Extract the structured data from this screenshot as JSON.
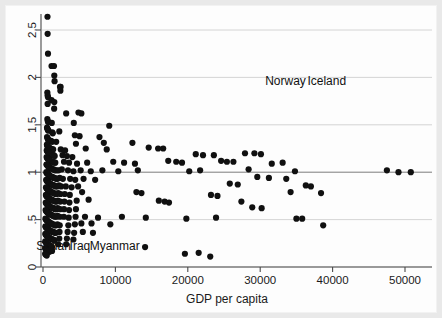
{
  "chart_data": {
    "type": "scatter",
    "title": "",
    "xlabel": "GDP per capita",
    "ylabel": "",
    "xlim": [
      -1500,
      53000
    ],
    "ylim": [
      0,
      2.72
    ],
    "xticks": [
      0,
      10000,
      20000,
      30000,
      40000,
      50000
    ],
    "xticklabels": [
      "0",
      "10000",
      "20000",
      "30000",
      "40000",
      "50000"
    ],
    "yticks": [
      0,
      0.5,
      1,
      1.5,
      2,
      2.5
    ],
    "yticklabels": [
      "0",
      ".5",
      "1",
      "1.5",
      "2",
      "2.5"
    ],
    "grid": "horizontal gridlines at each y tick; reference line emphasized at y=1",
    "reference_line_y": 1,
    "marker": "filled-circle",
    "marker_color": "#101010",
    "marker_size_px": 3.1,
    "legend": null,
    "annotations": [
      {
        "text": "Norway",
        "x": 33500,
        "y": 1.92,
        "anchor": "middle"
      },
      {
        "text": "Iceland",
        "x": 39200,
        "y": 1.92,
        "anchor": "middle"
      },
      {
        "text": "Sudan",
        "x": 1450,
        "y": 0.18,
        "anchor": "middle"
      },
      {
        "text": "Iraq",
        "x": 5100,
        "y": 0.18,
        "anchor": "middle"
      },
      {
        "text": "Myanmar",
        "x": 9900,
        "y": 0.18,
        "anchor": "middle"
      }
    ],
    "points": [
      [
        620,
        2.64
      ],
      [
        640,
        2.46
      ],
      [
        690,
        2.25
      ],
      [
        1180,
        2.12
      ],
      [
        1520,
        2.12
      ],
      [
        1560,
        2.02
      ],
      [
        1600,
        1.96
      ],
      [
        2350,
        1.9
      ],
      [
        2430,
        1.9
      ],
      [
        2400,
        1.86
      ],
      [
        600,
        1.84
      ],
      [
        640,
        1.81
      ],
      [
        700,
        1.79
      ],
      [
        1180,
        1.76
      ],
      [
        1560,
        1.74
      ],
      [
        640,
        1.72
      ],
      [
        1540,
        1.67
      ],
      [
        3200,
        1.62
      ],
      [
        4900,
        1.63
      ],
      [
        5300,
        1.62
      ],
      [
        600,
        1.56
      ],
      [
        660,
        1.54
      ],
      [
        700,
        1.53
      ],
      [
        1210,
        1.52
      ],
      [
        4250,
        1.52
      ],
      [
        9150,
        1.49
      ],
      [
        560,
        1.47
      ],
      [
        610,
        1.46
      ],
      [
        650,
        1.45
      ],
      [
        700,
        1.44
      ],
      [
        760,
        1.44
      ],
      [
        1280,
        1.42
      ],
      [
        1350,
        1.41
      ],
      [
        2250,
        1.43
      ],
      [
        4400,
        1.39
      ],
      [
        5050,
        1.38
      ],
      [
        7800,
        1.37
      ],
      [
        560,
        1.37
      ],
      [
        620,
        1.36
      ],
      [
        680,
        1.35
      ],
      [
        740,
        1.34
      ],
      [
        800,
        1.33
      ],
      [
        1120,
        1.33
      ],
      [
        1260,
        1.32
      ],
      [
        1820,
        1.32
      ],
      [
        4550,
        1.3
      ],
      [
        8400,
        1.31
      ],
      [
        12350,
        1.31
      ],
      [
        540,
        1.29
      ],
      [
        600,
        1.28
      ],
      [
        660,
        1.27
      ],
      [
        720,
        1.27
      ],
      [
        790,
        1.26
      ],
      [
        860,
        1.26
      ],
      [
        1050,
        1.25
      ],
      [
        1300,
        1.24
      ],
      [
        1400,
        1.24
      ],
      [
        2450,
        1.24
      ],
      [
        3050,
        1.23
      ],
      [
        5900,
        1.25
      ],
      [
        8800,
        1.24
      ],
      [
        14600,
        1.26
      ],
      [
        15900,
        1.25
      ],
      [
        16600,
        1.25
      ],
      [
        520,
        1.23
      ],
      [
        580,
        1.22
      ],
      [
        640,
        1.22
      ],
      [
        700,
        1.21
      ],
      [
        760,
        1.21
      ],
      [
        820,
        1.2
      ],
      [
        900,
        1.2
      ],
      [
        1000,
        1.19
      ],
      [
        1150,
        1.19
      ],
      [
        1330,
        1.18
      ],
      [
        1480,
        1.18
      ],
      [
        1620,
        1.17
      ],
      [
        2700,
        1.18
      ],
      [
        3300,
        1.17
      ],
      [
        4050,
        1.16
      ],
      [
        21100,
        1.19
      ],
      [
        22100,
        1.18
      ],
      [
        23600,
        1.18
      ],
      [
        27900,
        1.2
      ],
      [
        29200,
        1.2
      ],
      [
        30100,
        1.19
      ],
      [
        500,
        1.16
      ],
      [
        560,
        1.15
      ],
      [
        620,
        1.15
      ],
      [
        680,
        1.14
      ],
      [
        740,
        1.14
      ],
      [
        800,
        1.13
      ],
      [
        870,
        1.13
      ],
      [
        950,
        1.12
      ],
      [
        1060,
        1.12
      ],
      [
        1220,
        1.11
      ],
      [
        1390,
        1.11
      ],
      [
        1550,
        1.1
      ],
      [
        1700,
        1.1
      ],
      [
        2900,
        1.11
      ],
      [
        3600,
        1.1
      ],
      [
        4700,
        1.09
      ],
      [
        6100,
        1.1
      ],
      [
        9700,
        1.11
      ],
      [
        11200,
        1.1
      ],
      [
        12700,
        1.09
      ],
      [
        17300,
        1.12
      ],
      [
        18400,
        1.11
      ],
      [
        19200,
        1.1
      ],
      [
        24600,
        1.12
      ],
      [
        25400,
        1.11
      ],
      [
        26300,
        1.11
      ],
      [
        31600,
        1.09
      ],
      [
        33100,
        1.1
      ],
      [
        480,
        1.08
      ],
      [
        540,
        1.08
      ],
      [
        600,
        1.07
      ],
      [
        660,
        1.07
      ],
      [
        720,
        1.06
      ],
      [
        790,
        1.06
      ],
      [
        860,
        1.05
      ],
      [
        940,
        1.05
      ],
      [
        1030,
        1.04
      ],
      [
        1170,
        1.04
      ],
      [
        1320,
        1.03
      ],
      [
        1480,
        1.03
      ],
      [
        1640,
        1.02
      ],
      [
        1880,
        1.02
      ],
      [
        2150,
        1.02
      ],
      [
        2600,
        1.03
      ],
      [
        3450,
        1.02
      ],
      [
        4200,
        1.01
      ],
      [
        5200,
        1.02
      ],
      [
        6600,
        1.01
      ],
      [
        8200,
        1.02
      ],
      [
        10400,
        1.01
      ],
      [
        13100,
        1.02
      ],
      [
        20200,
        1.01
      ],
      [
        21700,
        1.02
      ],
      [
        28400,
        1.03
      ],
      [
        34800,
        1.01
      ],
      [
        47500,
        1.02
      ],
      [
        49100,
        1.0
      ],
      [
        50800,
        1.0
      ],
      [
        460,
        1.0
      ],
      [
        520,
        0.99
      ],
      [
        580,
        0.99
      ],
      [
        640,
        0.98
      ],
      [
        700,
        0.98
      ],
      [
        770,
        0.97
      ],
      [
        840,
        0.97
      ],
      [
        920,
        0.96
      ],
      [
        1010,
        0.96
      ],
      [
        1140,
        0.95
      ],
      [
        1290,
        0.95
      ],
      [
        1450,
        0.94
      ],
      [
        1610,
        0.94
      ],
      [
        1790,
        0.93
      ],
      [
        2000,
        0.93
      ],
      [
        2300,
        0.94
      ],
      [
        2750,
        0.93
      ],
      [
        3750,
        0.93
      ],
      [
        4450,
        0.92
      ],
      [
        5600,
        0.93
      ],
      [
        7200,
        0.92
      ],
      [
        29600,
        0.95
      ],
      [
        31200,
        0.94
      ],
      [
        33600,
        0.93
      ],
      [
        440,
        0.92
      ],
      [
        500,
        0.91
      ],
      [
        560,
        0.91
      ],
      [
        620,
        0.9
      ],
      [
        690,
        0.9
      ],
      [
        760,
        0.89
      ],
      [
        830,
        0.89
      ],
      [
        910,
        0.88
      ],
      [
        1000,
        0.88
      ],
      [
        1120,
        0.87
      ],
      [
        1250,
        0.87
      ],
      [
        1400,
        0.86
      ],
      [
        1560,
        0.86
      ],
      [
        1740,
        0.85
      ],
      [
        1950,
        0.85
      ],
      [
        2200,
        0.86
      ],
      [
        2500,
        0.85
      ],
      [
        3150,
        0.85
      ],
      [
        3950,
        0.84
      ],
      [
        4850,
        0.85
      ],
      [
        25800,
        0.88
      ],
      [
        26900,
        0.87
      ],
      [
        36300,
        0.86
      ],
      [
        37000,
        0.85
      ],
      [
        420,
        0.84
      ],
      [
        480,
        0.83
      ],
      [
        540,
        0.83
      ],
      [
        600,
        0.82
      ],
      [
        670,
        0.82
      ],
      [
        740,
        0.81
      ],
      [
        810,
        0.81
      ],
      [
        890,
        0.8
      ],
      [
        980,
        0.8
      ],
      [
        1100,
        0.79
      ],
      [
        1240,
        0.79
      ],
      [
        1380,
        0.78
      ],
      [
        1540,
        0.78
      ],
      [
        1720,
        0.77
      ],
      [
        1900,
        0.77
      ],
      [
        2100,
        0.78
      ],
      [
        2420,
        0.77
      ],
      [
        3000,
        0.77
      ],
      [
        3700,
        0.76
      ],
      [
        5400,
        0.79
      ],
      [
        12900,
        0.79
      ],
      [
        13600,
        0.78
      ],
      [
        23200,
        0.76
      ],
      [
        24100,
        0.75
      ],
      [
        34200,
        0.79
      ],
      [
        38400,
        0.78
      ],
      [
        400,
        0.76
      ],
      [
        460,
        0.75
      ],
      [
        520,
        0.75
      ],
      [
        580,
        0.74
      ],
      [
        650,
        0.74
      ],
      [
        720,
        0.73
      ],
      [
        790,
        0.73
      ],
      [
        870,
        0.72
      ],
      [
        960,
        0.72
      ],
      [
        1080,
        0.71
      ],
      [
        1210,
        0.71
      ],
      [
        1350,
        0.7
      ],
      [
        1510,
        0.7
      ],
      [
        1690,
        0.69
      ],
      [
        1880,
        0.69
      ],
      [
        2060,
        0.7
      ],
      [
        2380,
        0.69
      ],
      [
        2950,
        0.69
      ],
      [
        3650,
        0.68
      ],
      [
        4650,
        0.7
      ],
      [
        6300,
        0.71
      ],
      [
        16000,
        0.7
      ],
      [
        16800,
        0.69
      ],
      [
        17400,
        0.68
      ],
      [
        27400,
        0.69
      ],
      [
        380,
        0.68
      ],
      [
        440,
        0.67
      ],
      [
        500,
        0.67
      ],
      [
        560,
        0.66
      ],
      [
        630,
        0.66
      ],
      [
        700,
        0.65
      ],
      [
        770,
        0.65
      ],
      [
        850,
        0.64
      ],
      [
        940,
        0.64
      ],
      [
        1060,
        0.63
      ],
      [
        1190,
        0.63
      ],
      [
        1330,
        0.62
      ],
      [
        1490,
        0.62
      ],
      [
        1660,
        0.61
      ],
      [
        1850,
        0.61
      ],
      [
        2030,
        0.62
      ],
      [
        2350,
        0.61
      ],
      [
        2900,
        0.61
      ],
      [
        3600,
        0.6
      ],
      [
        4550,
        0.61
      ],
      [
        28900,
        0.63
      ],
      [
        30200,
        0.62
      ],
      [
        360,
        0.6
      ],
      [
        420,
        0.59
      ],
      [
        480,
        0.59
      ],
      [
        540,
        0.58
      ],
      [
        610,
        0.58
      ],
      [
        680,
        0.57
      ],
      [
        750,
        0.57
      ],
      [
        830,
        0.56
      ],
      [
        920,
        0.56
      ],
      [
        1040,
        0.55
      ],
      [
        1170,
        0.55
      ],
      [
        1310,
        0.54
      ],
      [
        1470,
        0.54
      ],
      [
        1640,
        0.53
      ],
      [
        1830,
        0.53
      ],
      [
        2010,
        0.54
      ],
      [
        2330,
        0.53
      ],
      [
        2880,
        0.53
      ],
      [
        3550,
        0.52
      ],
      [
        4500,
        0.53
      ],
      [
        5800,
        0.53
      ],
      [
        7600,
        0.52
      ],
      [
        10900,
        0.53
      ],
      [
        14200,
        0.52
      ],
      [
        19800,
        0.51
      ],
      [
        23900,
        0.52
      ],
      [
        35000,
        0.51
      ],
      [
        35800,
        0.51
      ],
      [
        340,
        0.51
      ],
      [
        400,
        0.5
      ],
      [
        460,
        0.5
      ],
      [
        520,
        0.49
      ],
      [
        590,
        0.49
      ],
      [
        660,
        0.48
      ],
      [
        730,
        0.48
      ],
      [
        810,
        0.47
      ],
      [
        900,
        0.47
      ],
      [
        1020,
        0.46
      ],
      [
        1150,
        0.46
      ],
      [
        1290,
        0.45
      ],
      [
        1450,
        0.45
      ],
      [
        1620,
        0.44
      ],
      [
        1810,
        0.44
      ],
      [
        1990,
        0.45
      ],
      [
        2310,
        0.44
      ],
      [
        3500,
        0.44
      ],
      [
        4400,
        0.45
      ],
      [
        5300,
        0.46
      ],
      [
        6700,
        0.46
      ],
      [
        9300,
        0.45
      ],
      [
        38700,
        0.44
      ],
      [
        330,
        0.43
      ],
      [
        390,
        0.42
      ],
      [
        450,
        0.42
      ],
      [
        510,
        0.41
      ],
      [
        580,
        0.41
      ],
      [
        650,
        0.4
      ],
      [
        720,
        0.4
      ],
      [
        800,
        0.39
      ],
      [
        890,
        0.39
      ],
      [
        1010,
        0.38
      ],
      [
        1140,
        0.38
      ],
      [
        1280,
        0.37
      ],
      [
        1440,
        0.37
      ],
      [
        1600,
        0.36
      ],
      [
        1790,
        0.36
      ],
      [
        2280,
        0.37
      ],
      [
        3400,
        0.37
      ],
      [
        4300,
        0.36
      ],
      [
        5500,
        0.37
      ],
      [
        6900,
        0.36
      ],
      [
        320,
        0.35
      ],
      [
        380,
        0.34
      ],
      [
        440,
        0.34
      ],
      [
        500,
        0.33
      ],
      [
        570,
        0.33
      ],
      [
        640,
        0.32
      ],
      [
        710,
        0.32
      ],
      [
        790,
        0.31
      ],
      [
        880,
        0.31
      ],
      [
        1000,
        0.3
      ],
      [
        1130,
        0.3
      ],
      [
        1270,
        0.29
      ],
      [
        1430,
        0.29
      ],
      [
        1590,
        0.28
      ],
      [
        2250,
        0.3
      ],
      [
        3300,
        0.3
      ],
      [
        4200,
        0.29
      ],
      [
        310,
        0.27
      ],
      [
        370,
        0.26
      ],
      [
        430,
        0.26
      ],
      [
        490,
        0.25
      ],
      [
        560,
        0.25
      ],
      [
        630,
        0.24
      ],
      [
        700,
        0.24
      ],
      [
        780,
        0.23
      ],
      [
        870,
        0.23
      ],
      [
        990,
        0.22
      ],
      [
        1120,
        0.22
      ],
      [
        1260,
        0.21
      ],
      [
        2100,
        0.24
      ],
      [
        3200,
        0.24
      ],
      [
        300,
        0.2
      ],
      [
        360,
        0.19
      ],
      [
        420,
        0.19
      ],
      [
        480,
        0.18
      ],
      [
        640,
        0.17
      ],
      [
        900,
        0.16
      ],
      [
        1250,
        0.17
      ],
      [
        14100,
        0.21
      ],
      [
        19600,
        0.14
      ],
      [
        21500,
        0.15
      ],
      [
        23100,
        0.11
      ],
      [
        300,
        0.14
      ],
      [
        380,
        0.13
      ],
      [
        520,
        0.12
      ]
    ]
  }
}
